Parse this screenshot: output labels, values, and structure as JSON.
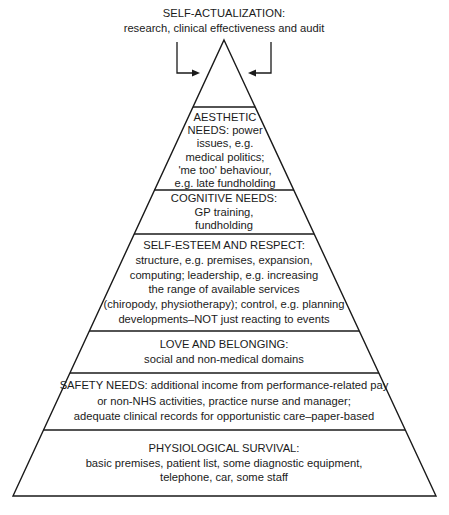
{
  "diagram": {
    "type": "pyramid",
    "top_label": {
      "title": "SELF-ACTUALIZATION:",
      "lines": [
        "research, clinical effectiveness and audit"
      ]
    },
    "levels": [
      {
        "name": "aesthetic-needs",
        "lines": [
          "AESTHETIC",
          "NEEDS: power",
          "issues, e.g.",
          "medical politics;",
          "'me too' behaviour,",
          "e.g. late fundholding"
        ]
      },
      {
        "name": "cognitive-needs",
        "lines": [
          "COGNITIVE NEEDS:",
          "GP training,",
          "fundholding"
        ]
      },
      {
        "name": "self-esteem-and-respect",
        "lines": [
          "SELF-ESTEEM AND RESPECT:",
          "structure, e.g. premises, expansion,",
          "computing; leadership, e.g. increasing",
          "the range of available services",
          "(chiropody, physiotherapy); control, e.g. planning",
          "developments–NOT just reacting to events"
        ]
      },
      {
        "name": "love-and-belonging",
        "lines": [
          "LOVE AND BELONGING:",
          "social and non-medical domains"
        ]
      },
      {
        "name": "safety-needs",
        "lines": [
          "SAFETY NEEDS: additional income from performance-related pay",
          "or non-NHS activities, practice nurse and manager;",
          "adequate clinical records for opportunistic care–paper-based"
        ]
      },
      {
        "name": "physiological-survival",
        "lines": [
          "PHYSIOLOGICAL SURVIVAL:",
          "basic premises, patient list, some diagnostic equipment,",
          "telephone, car, some staff"
        ]
      }
    ],
    "colors": {
      "line": "#1a1a1a",
      "background": "#ffffff"
    }
  }
}
